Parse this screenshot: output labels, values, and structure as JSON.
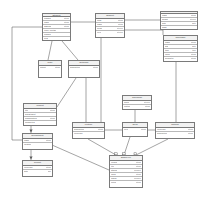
{
  "diagram": {
    "type": "uml-class-diagram",
    "background": "#ffffff",
    "line_color": "#5a5a5a",
    "border_color": "#7a7a7a",
    "header_fill": "#f2f2f2"
  },
  "classes": [
    {
      "id": "student",
      "name": "Student",
      "x": 42,
      "y": 13,
      "w": 29,
      "h": 28,
      "attributes": [
        {
          "name": "number",
          "type": "string"
        },
        {
          "name": "name",
          "type": "string"
        },
        {
          "name": "address",
          "type": "string"
        },
        {
          "name": "enrol.  contact",
          "type": ""
        },
        {
          "name": "number",
          "type": ""
        },
        {
          "name": "year",
          "type": ""
        }
      ]
    },
    {
      "id": "subject",
      "name": "Subject",
      "x": 95,
      "y": 13,
      "w": 30,
      "h": 25,
      "attributes": [
        {
          "name": "code",
          "type": "string"
        },
        {
          "name": "name",
          "type": "string"
        },
        {
          "name": "credit",
          "type": "integer"
        },
        {
          "name": "level",
          "type": "integer"
        }
      ]
    },
    {
      "id": "exam",
      "name": "Exam",
      "x": 160,
      "y": 11,
      "w": 38,
      "h": 19,
      "attributes": [
        {
          "name": "name",
          "type": "string"
        },
        {
          "name": "weight",
          "type": "integer"
        },
        {
          "name": "date",
          "type": "date"
        },
        {
          "name": "mark",
          "type": ""
        }
      ]
    },
    {
      "id": "timetable",
      "name": "Timetable",
      "x": 163,
      "y": 35,
      "w": 35,
      "h": 27,
      "attributes": [
        {
          "name": "name",
          "type": "string"
        },
        {
          "name": "day",
          "type": "date"
        },
        {
          "name": "time",
          "type": "time"
        },
        {
          "name": "room",
          "type": "string"
        },
        {
          "name": "semester",
          "type": "string"
        }
      ]
    },
    {
      "id": "rate",
      "name": "Rate",
      "x": 38,
      "y": 60,
      "w": 24,
      "h": 18,
      "attributes": [
        {
          "name": "project",
          "type": "string"
        }
      ]
    },
    {
      "id": "outcome",
      "name": "Outcome",
      "x": 68,
      "y": 60,
      "w": 32,
      "h": 18,
      "attributes": [
        {
          "name": "description",
          "type": "string"
        }
      ]
    },
    {
      "id": "project",
      "name": "Project",
      "x": 23,
      "y": 103,
      "w": 34,
      "h": 23,
      "attributes": [
        {
          "name": "title",
          "type": "string"
        },
        {
          "name": "department",
          "type": ""
        },
        {
          "name": "classification",
          "type": "string"
        },
        {
          "name": "completed",
          "type": ""
        }
      ]
    },
    {
      "id": "department",
      "name": "Department",
      "x": 22,
      "y": 133,
      "w": 31,
      "h": 17,
      "attributes": [
        {
          "name": "name",
          "type": "string"
        },
        {
          "name": "location",
          "type": ""
        }
      ]
    },
    {
      "id": "report",
      "name": "Report",
      "x": 22,
      "y": 160,
      "w": 31,
      "h": 17,
      "attributes": [
        {
          "name": "reference",
          "type": "string"
        },
        {
          "name": "date",
          "type": "day"
        }
      ]
    },
    {
      "id": "timespan",
      "name": "Timespan",
      "x": 122,
      "y": 95,
      "w": 30,
      "h": 15,
      "attributes": [
        {
          "name": "hours",
          "type": "integer"
        },
        {
          "name": "pattern",
          "type": "string"
        }
      ]
    },
    {
      "id": "lecture",
      "name": "Lecture",
      "x": 72,
      "y": 122,
      "w": 33,
      "h": 17,
      "attributes": [
        {
          "name": "description",
          "type": "string"
        },
        {
          "name": "reference",
          "type": ""
        }
      ]
    },
    {
      "id": "term",
      "name": "Term",
      "x": 122,
      "y": 122,
      "w": 26,
      "h": 15,
      "attributes": [
        {
          "name": "level",
          "type": "string"
        }
      ]
    },
    {
      "id": "tutorial",
      "name": "Tutorial",
      "x": 155,
      "y": 122,
      "w": 40,
      "h": 17,
      "attributes": [
        {
          "name": "reference",
          "type": "string"
        },
        {
          "name": "description",
          "type": "string"
        }
      ]
    },
    {
      "id": "employee",
      "name": "Employee",
      "x": 109,
      "y": 155,
      "w": 34,
      "h": 33,
      "attributes": [
        {
          "name": "refnum",
          "type": "string"
        },
        {
          "name": "title",
          "type": "string"
        },
        {
          "name": "staffno",
          "type": "number"
        },
        {
          "name": "room",
          "type": "string"
        },
        {
          "name": "phone",
          "type": "number"
        },
        {
          "name": "notes",
          "type": "string"
        }
      ]
    }
  ],
  "edges": [
    {
      "from": "student",
      "to": "subject",
      "label": ""
    },
    {
      "from": "student",
      "to": "rate",
      "label": ""
    },
    {
      "from": "student",
      "to": "outcome",
      "label": ""
    },
    {
      "from": "student",
      "to": "project",
      "label": ""
    },
    {
      "from": "subject",
      "to": "exam",
      "label": ""
    },
    {
      "from": "subject",
      "to": "timetable",
      "label": ""
    },
    {
      "from": "subject",
      "to": "lecture",
      "label": ""
    },
    {
      "from": "outcome",
      "to": "project",
      "label": ""
    },
    {
      "from": "outcome",
      "to": "lecture",
      "label": ""
    },
    {
      "from": "timespan",
      "to": "term",
      "label": ""
    },
    {
      "from": "timetable",
      "to": "tutorial",
      "label": ""
    },
    {
      "from": "lecture",
      "to": "term",
      "label": ""
    },
    {
      "from": "term",
      "to": "tutorial",
      "label": ""
    },
    {
      "from": "lecture",
      "to": "employee",
      "label": ""
    },
    {
      "from": "term",
      "to": "employee",
      "label": ""
    },
    {
      "from": "tutorial",
      "to": "employee",
      "label": ""
    },
    {
      "from": "department",
      "to": "report",
      "label": ""
    },
    {
      "from": "department",
      "to": "employee",
      "label": ""
    },
    {
      "from": "project",
      "to": "department",
      "label": ""
    }
  ]
}
